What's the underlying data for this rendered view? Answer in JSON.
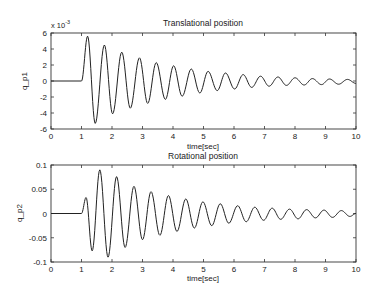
{
  "chart_data": [
    {
      "type": "line",
      "title": "Translational position",
      "xlabel": "time[sec]",
      "ylabel": "q_p1",
      "y_multiplier_label": "x 10",
      "y_multiplier_exp": "-3",
      "xlim": [
        0,
        10
      ],
      "ylim": [
        -6,
        6
      ],
      "xticks": [
        0,
        1,
        2,
        3,
        4,
        5,
        6,
        7,
        8,
        9,
        10
      ],
      "yticks": [
        -6,
        -4,
        -2,
        0,
        2,
        4,
        6
      ],
      "grid": false,
      "series": [
        {
          "name": "q_p1",
          "x": [
            0,
            1.0,
            1.2,
            1.45,
            1.75,
            2.02,
            2.32,
            2.6,
            2.9,
            3.17,
            3.45,
            3.75,
            4.02,
            4.3,
            4.6,
            4.88,
            5.15,
            5.45,
            5.72,
            6.02,
            6.3,
            6.58,
            6.87,
            7.15,
            7.44,
            7.72,
            8.0,
            8.3,
            8.57,
            8.87,
            9.13,
            9.43,
            9.72,
            10.0
          ],
          "y": [
            0,
            0,
            5.6,
            -5.3,
            4.5,
            -4.1,
            3.6,
            -3.4,
            2.9,
            -2.8,
            2.3,
            -2.3,
            1.9,
            -1.9,
            1.5,
            -1.5,
            1.2,
            -1.2,
            1.0,
            -1.0,
            0.8,
            -0.8,
            0.6,
            -0.65,
            0.5,
            -0.55,
            0.4,
            -0.5,
            0.3,
            -0.45,
            0.25,
            -0.4,
            0.2,
            -0.3
          ]
        }
      ]
    },
    {
      "type": "line",
      "title": "Rotational position",
      "xlabel": "time[sec]",
      "ylabel": "q_p2",
      "xlim": [
        0,
        10
      ],
      "ylim": [
        -0.1,
        0.1
      ],
      "xticks": [
        0,
        1,
        2,
        3,
        4,
        5,
        6,
        7,
        8,
        9,
        10
      ],
      "yticks": [
        -0.1,
        -0.05,
        0,
        0.05,
        0.1
      ],
      "ytick_labels": [
        "-0.1",
        "-0.05",
        "0",
        "0.05",
        "0.1"
      ],
      "grid": false,
      "series": [
        {
          "name": "q_p2",
          "x": [
            0,
            1.0,
            1.15,
            1.35,
            1.6,
            1.87,
            2.15,
            2.43,
            2.72,
            3.0,
            3.28,
            3.57,
            3.85,
            4.13,
            4.42,
            4.7,
            4.98,
            5.27,
            5.55,
            5.83,
            6.12,
            6.4,
            6.68,
            6.97,
            7.25,
            7.53,
            7.82,
            8.1,
            8.38,
            8.67,
            8.95,
            9.23,
            9.52,
            9.8,
            10.0
          ],
          "y": [
            0,
            0,
            0.033,
            -0.077,
            0.09,
            -0.09,
            0.076,
            -0.07,
            0.056,
            -0.054,
            0.045,
            -0.045,
            0.037,
            -0.037,
            0.03,
            -0.03,
            0.024,
            -0.025,
            0.02,
            -0.02,
            0.016,
            -0.017,
            0.013,
            -0.014,
            0.011,
            -0.012,
            0.009,
            -0.011,
            0.008,
            -0.009,
            0.007,
            -0.008,
            0.006,
            -0.006,
            0.0
          ]
        }
      ]
    }
  ]
}
